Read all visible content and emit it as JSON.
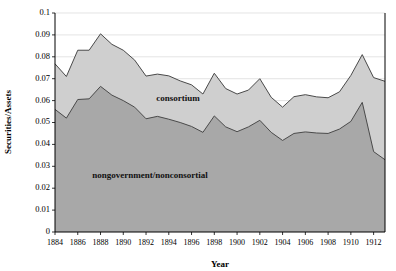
{
  "chart_data": {
    "type": "area",
    "stacked": true,
    "title": "",
    "xlabel": "Year",
    "ylabel": "Securities/Assets",
    "xlim": [
      1884,
      1913
    ],
    "ylim": [
      0,
      0.1
    ],
    "grid": true,
    "legend_position": "inline-annotation",
    "x": [
      1884,
      1885,
      1886,
      1887,
      1888,
      1889,
      1890,
      1891,
      1892,
      1893,
      1894,
      1895,
      1896,
      1897,
      1898,
      1899,
      1900,
      1901,
      1902,
      1903,
      1904,
      1905,
      1906,
      1907,
      1908,
      1909,
      1910,
      1911,
      1912,
      1913
    ],
    "xticks": [
      1884,
      1886,
      1888,
      1890,
      1892,
      1894,
      1896,
      1898,
      1900,
      1902,
      1904,
      1906,
      1908,
      1910,
      1912
    ],
    "yticks": [
      0,
      0.01,
      0.02,
      0.03,
      0.04,
      0.05,
      0.06,
      0.07,
      0.08,
      0.09,
      0.1
    ],
    "ytick_labels": [
      "0",
      "0.01",
      "0.02",
      "0.03",
      "0.04",
      "0.05",
      "0.06",
      "0.07",
      "0.08",
      "0.09",
      "0.1"
    ],
    "series": [
      {
        "name": "nongovernment/nonconsortial",
        "label": "nongovernment/nonconsortial",
        "color": "#a8a8a8",
        "values": [
          0.056,
          0.052,
          0.0605,
          0.0608,
          0.0665,
          0.0625,
          0.06,
          0.057,
          0.0517,
          0.0528,
          0.0515,
          0.05,
          0.0482,
          0.0455,
          0.053,
          0.048,
          0.0458,
          0.048,
          0.051,
          0.0455,
          0.0418,
          0.045,
          0.0457,
          0.0452,
          0.045,
          0.047,
          0.0505,
          0.0592,
          0.0367,
          0.033
        ]
      },
      {
        "name": "consortium",
        "label": "consortium",
        "color": "#cfcfcf",
        "values": [
          0.0208,
          0.019,
          0.0225,
          0.0222,
          0.024,
          0.0232,
          0.023,
          0.0215,
          0.0195,
          0.0193,
          0.0198,
          0.019,
          0.019,
          0.0175,
          0.0195,
          0.0175,
          0.0172,
          0.0168,
          0.019,
          0.016,
          0.0152,
          0.0168,
          0.017,
          0.0165,
          0.0163,
          0.017,
          0.021,
          0.0218,
          0.0338,
          0.0358
        ]
      }
    ],
    "totals": [
      0.0768,
      0.071,
      0.083,
      0.083,
      0.0905,
      0.0857,
      0.083,
      0.0785,
      0.0712,
      0.0721,
      0.0713,
      0.069,
      0.0672,
      0.063,
      0.0725,
      0.0655,
      0.063,
      0.0648,
      0.07,
      0.0615,
      0.057,
      0.0618,
      0.0627,
      0.0617,
      0.0613,
      0.064,
      0.0715,
      0.081,
      0.0705,
      0.0688
    ]
  },
  "annotations": {
    "consortium_label": "consortium",
    "nongovernment_label": "nongovernment/nonconsortial"
  },
  "axes": {
    "x_title": "Year",
    "y_title": "Securities/Assets"
  }
}
